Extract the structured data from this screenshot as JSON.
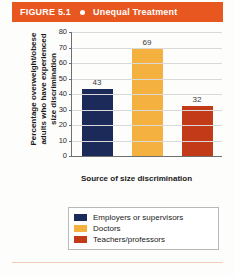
{
  "figure": {
    "number_label": "FIGURE 5.1",
    "bullet_icon": "bullet-dot-icon",
    "title": "Unequal Treatment",
    "banner_color": "#e8571f",
    "rule_color": "#f0cdb8"
  },
  "chart_data": {
    "type": "bar",
    "title": "Unequal Treatment",
    "categories": [
      "Employers or supervisors",
      "Doctors",
      "Teachers/professors"
    ],
    "values": [
      43,
      69,
      32
    ],
    "xlabel": "Source of size discrimination",
    "ylabel_lines": [
      "Percentage overweight/obese",
      "adults who have experienced",
      "size discrimination"
    ],
    "ylim": [
      0,
      80
    ],
    "yticks": [
      80,
      70,
      60,
      50,
      40,
      30,
      20,
      10,
      0
    ],
    "grid": true,
    "legend_position": "bottom",
    "colors": [
      "#1b2a58",
      "#f5b13f",
      "#c23a17"
    ]
  },
  "legend": {
    "items": [
      {
        "label": "Employers or supervisors",
        "color": "#1b2a58"
      },
      {
        "label": "Doctors",
        "color": "#f5b13f"
      },
      {
        "label": "Teachers/professors",
        "color": "#c23a17"
      }
    ]
  }
}
